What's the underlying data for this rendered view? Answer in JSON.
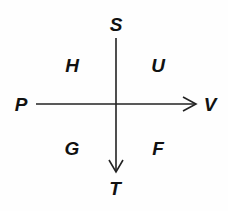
{
  "diagram": {
    "type": "axes-cross",
    "line_color": "#222222",
    "label_color": "#111111",
    "vertical_axis": {
      "top_label": "S",
      "bottom_label": "T",
      "arrow_direction": "down"
    },
    "horizontal_axis": {
      "left_label": "P",
      "right_label": "V",
      "arrow_direction": "right"
    },
    "quadrants": {
      "top_left": "H",
      "top_right": "U",
      "bottom_left": "G",
      "bottom_right": "F"
    }
  }
}
